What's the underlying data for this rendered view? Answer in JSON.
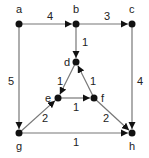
{
  "diagram": {
    "type": "directed-weighted-graph",
    "nodes": [
      {
        "id": "a",
        "label": "a",
        "x": 19,
        "y": 24,
        "lx": 16,
        "ly": 13
      },
      {
        "id": "b",
        "label": "b",
        "x": 76,
        "y": 24,
        "lx": 73,
        "ly": 13
      },
      {
        "id": "c",
        "label": "c",
        "x": 132,
        "y": 24,
        "lx": 129,
        "ly": 13
      },
      {
        "id": "d",
        "label": "d",
        "x": 76,
        "y": 62,
        "lx": 64,
        "ly": 66
      },
      {
        "id": "e",
        "label": "e",
        "x": 58,
        "y": 98,
        "lx": 45,
        "ly": 102
      },
      {
        "id": "f",
        "label": "f",
        "x": 94,
        "y": 98,
        "lx": 101,
        "ly": 102
      },
      {
        "id": "g",
        "label": "g",
        "x": 19,
        "y": 133,
        "lx": 16,
        "ly": 150
      },
      {
        "id": "h",
        "label": "h",
        "x": 132,
        "y": 133,
        "lx": 129,
        "ly": 150
      }
    ],
    "edges": [
      {
        "from": "a",
        "to": "b",
        "weight": "4",
        "wx": 47,
        "wy": 20
      },
      {
        "from": "b",
        "to": "c",
        "weight": "3",
        "wx": 104,
        "wy": 20
      },
      {
        "from": "b",
        "to": "d",
        "weight": "1",
        "wx": 82,
        "wy": 46
      },
      {
        "from": "a",
        "to": "g",
        "weight": "5",
        "wx": 8,
        "wy": 85
      },
      {
        "from": "c",
        "to": "h",
        "weight": "4",
        "wx": 137,
        "wy": 85
      },
      {
        "from": "d",
        "to": "e",
        "weight": "1",
        "wx": 57,
        "wy": 85
      },
      {
        "from": "f",
        "to": "d",
        "weight": "1",
        "wx": 90,
        "wy": 85
      },
      {
        "from": "e",
        "to": "f",
        "weight": "1",
        "wx": 73,
        "wy": 111
      },
      {
        "from": "g",
        "to": "e",
        "weight": "2",
        "wx": 42,
        "wy": 122
      },
      {
        "from": "f",
        "to": "h",
        "weight": "2",
        "wx": 103,
        "wy": 122
      },
      {
        "from": "g",
        "to": "h",
        "weight": "1",
        "wx": 73,
        "wy": 146
      }
    ]
  }
}
